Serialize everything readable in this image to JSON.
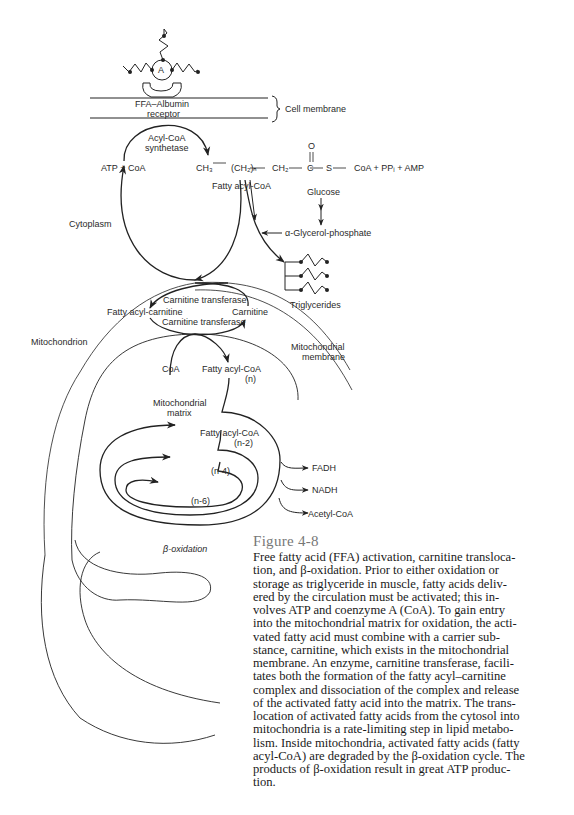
{
  "diagram": {
    "albumin_label": "A",
    "receptor_label": [
      "FFA–Albumin",
      "receptor"
    ],
    "cell_membrane": "Cell membrane",
    "enzyme_synthetase": [
      "Acyl-CoA",
      "synthetase"
    ],
    "atp_coa": "ATP + CoA",
    "formula": {
      "ch3": "CH₃",
      "ch2n": "(CH₂)ₙ",
      "ch2": "CH₂",
      "c": "C",
      "o": "O",
      "s": "S",
      "tail": "CoA + PPᵢ + AMP"
    },
    "fatty_acyl_coa": "Fatty acyl-CoA",
    "glucose": "Glucose",
    "glycerol_phosphate": "α-Glycerol-phosphate",
    "triglycerides": "Triglycerides",
    "cytoplasm": "Cytoplasm",
    "carnitine_transferase_top": "Carnitine transferase",
    "carnitine_transferase_bottom": "Carnitine transferase",
    "fatty_acyl_carnitine": "Fatty acyl-carnitine",
    "carnitine": "Carnitine",
    "mitochondrion": "Mitochondrion",
    "mito_membrane": [
      "Mitochondrial",
      "membrane"
    ],
    "coa": "CoA",
    "fatty_acyl_coa_n": [
      "Fatty acyl-CoA",
      "(n)"
    ],
    "mito_matrix": [
      "Mitochondrial",
      "matrix"
    ],
    "fatty_acyl_coa_n2": [
      "Fatty acyl-CoA",
      "(n-2)"
    ],
    "n4": "(n-4)",
    "n6": "(n-6)",
    "fadh": "FADH",
    "nadh": "NADH",
    "acetyl_coa": "Acetyl-CoA",
    "beta_oxidation": "β-oxidation"
  },
  "caption": {
    "title": "Figure 4-8",
    "lines": [
      "Free fatty acid (FFA) activation, carnitine transloca-",
      "tion, and β-oxidation. Prior to either oxidation or",
      "storage as triglyceride in muscle, fatty acids deliv-",
      "ered by the circulation must be activated; this in-",
      "volves ATP and coenzyme A (CoA). To gain entry",
      "into the mitochondrial matrix for oxidation, the acti-",
      "vated fatty acid must combine with a carrier sub-",
      "stance, carnitine, which exists in the mitochondrial",
      "membrane. An enzyme, carnitine transferase, facili-",
      "tates both the formation of the fatty acyl–carnitine",
      "complex and dissociation of the complex and release",
      "of the activated fatty acid into the matrix. The trans-",
      "location of activated fatty acids from the cytosol into",
      "mitochondria is a rate-limiting step in lipid metabo-",
      "lism. Inside mitochondria, activated fatty acids (fatty",
      "acyl-CoA) are degraded by the β-oxidation cycle. The",
      "products of β-oxidation result in great ATP produc-",
      "tion."
    ]
  }
}
